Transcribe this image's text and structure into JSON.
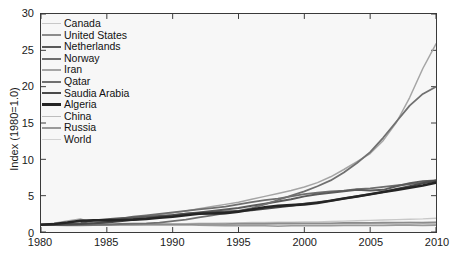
{
  "chart_data": {
    "type": "line",
    "title": "",
    "xlabel": "",
    "ylabel": "Index (1980=1.0)",
    "xlim": [
      1980,
      2010
    ],
    "ylim": [
      0,
      30
    ],
    "xticks": [
      1980,
      1985,
      1990,
      1995,
      2000,
      2005,
      2010
    ],
    "yticks": [
      0,
      5,
      10,
      15,
      20,
      25,
      30
    ],
    "grid": false,
    "legend_position": "upper-left-inside",
    "x": [
      1980,
      1981,
      1982,
      1983,
      1984,
      1985,
      1986,
      1987,
      1988,
      1989,
      1990,
      1991,
      1992,
      1993,
      1994,
      1995,
      1996,
      1997,
      1998,
      1999,
      2000,
      2001,
      2002,
      2003,
      2004,
      2005,
      2006,
      2007,
      2008,
      2009,
      2010
    ],
    "series": [
      {
        "name": "Canada",
        "color": "#c8c8c8",
        "width": 1.4,
        "values": [
          1.0,
          1.0,
          1.0,
          1.0,
          1.05,
          1.05,
          1.05,
          1.1,
          1.1,
          1.15,
          1.15,
          1.15,
          1.2,
          1.2,
          1.25,
          1.25,
          1.3,
          1.3,
          1.35,
          1.35,
          1.4,
          1.4,
          1.45,
          1.5,
          1.55,
          1.6,
          1.65,
          1.7,
          1.75,
          1.8,
          1.9
        ]
      },
      {
        "name": "United States",
        "color": "#8c8c8c",
        "width": 1.7,
        "values": [
          1.0,
          0.95,
          0.9,
          0.9,
          0.95,
          0.95,
          1.0,
          1.0,
          1.05,
          1.05,
          1.05,
          1.05,
          1.1,
          1.1,
          1.1,
          1.15,
          1.15,
          1.15,
          1.2,
          1.2,
          1.2,
          1.2,
          1.2,
          1.25,
          1.25,
          1.25,
          1.3,
          1.3,
          1.3,
          1.25,
          1.3
        ]
      },
      {
        "name": "Netherlands",
        "color": "#5a5a5a",
        "width": 2.0,
        "values": [
          1.0,
          1.05,
          1.1,
          1.2,
          1.6,
          1.75,
          1.9,
          2.0,
          2.1,
          2.2,
          2.3,
          2.5,
          2.7,
          2.9,
          3.1,
          3.3,
          3.6,
          3.9,
          4.2,
          4.5,
          4.9,
          5.2,
          5.4,
          5.6,
          5.8,
          5.7,
          5.8,
          6.3,
          6.7,
          7.0,
          7.1
        ]
      },
      {
        "name": "Norway",
        "color": "#6e6e6e",
        "width": 1.8,
        "values": [
          1.0,
          1.0,
          0.95,
          1.0,
          1.1,
          1.4,
          1.8,
          2.1,
          2.3,
          2.5,
          2.7,
          2.9,
          3.1,
          3.3,
          3.5,
          3.8,
          4.1,
          4.4,
          4.6,
          4.9,
          5.2,
          5.4,
          5.6,
          5.7,
          5.9,
          6.0,
          6.2,
          6.4,
          6.6,
          6.8,
          7.0
        ]
      },
      {
        "name": "Iran",
        "color": "#a5a5a5",
        "width": 1.5,
        "values": [
          1.0,
          1.2,
          1.5,
          1.8,
          1.2,
          1.3,
          1.6,
          1.9,
          2.1,
          2.4,
          2.6,
          2.9,
          3.2,
          3.5,
          3.8,
          4.1,
          4.5,
          4.9,
          5.3,
          5.7,
          6.2,
          6.8,
          7.6,
          8.6,
          9.7,
          10.8,
          12.6,
          15.1,
          18.5,
          22.5,
          25.9
        ]
      },
      {
        "name": "Qatar",
        "color": "#707070",
        "width": 1.8,
        "values": [
          1.0,
          1.0,
          1.0,
          1.0,
          1.0,
          1.05,
          1.1,
          1.15,
          1.2,
          1.3,
          1.5,
          1.7,
          2.0,
          2.3,
          2.6,
          2.9,
          3.3,
          3.8,
          4.4,
          5.0,
          5.6,
          6.3,
          7.1,
          8.2,
          9.5,
          11.0,
          13.0,
          15.2,
          17.4,
          19.0,
          20.0
        ]
      },
      {
        "name": "Saudia Arabia",
        "color": "#4a4a4a",
        "width": 2.1,
        "values": [
          1.0,
          1.0,
          1.05,
          1.1,
          1.2,
          1.3,
          1.5,
          1.7,
          1.9,
          2.1,
          2.3,
          2.5,
          2.6,
          2.7,
          2.8,
          2.9,
          3.0,
          3.2,
          3.4,
          3.6,
          3.9,
          4.1,
          4.3,
          4.6,
          4.9,
          5.2,
          5.5,
          5.9,
          6.3,
          6.7,
          7.1
        ]
      },
      {
        "name": "Algeria",
        "color": "#252525",
        "width": 2.6,
        "values": [
          1.0,
          1.1,
          1.3,
          1.55,
          1.6,
          1.6,
          1.65,
          1.7,
          1.8,
          1.95,
          2.1,
          2.3,
          2.5,
          2.55,
          2.6,
          2.8,
          3.1,
          3.4,
          3.6,
          3.7,
          3.8,
          4.0,
          4.3,
          4.6,
          4.9,
          5.2,
          5.5,
          5.8,
          6.1,
          6.4,
          6.8
        ]
      },
      {
        "name": "China",
        "color": "#bdbdbd",
        "width": 1.4,
        "values": [
          1.0,
          1.0,
          1.0,
          1.0,
          1.0,
          1.0,
          1.0,
          1.0,
          1.0,
          1.0,
          1.0,
          1.0,
          1.05,
          1.05,
          1.05,
          1.05,
          1.05,
          1.05,
          1.05,
          1.05,
          1.1,
          1.1,
          1.1,
          1.15,
          1.15,
          1.2,
          1.2,
          1.25,
          1.3,
          1.35,
          1.4
        ]
      },
      {
        "name": "Russia",
        "color": "#9a9a9a",
        "width": 1.6,
        "values": [
          1.0,
          1.0,
          1.0,
          1.0,
          1.0,
          1.0,
          1.0,
          1.0,
          1.0,
          1.0,
          1.0,
          1.0,
          0.95,
          0.9,
          0.85,
          0.85,
          0.85,
          0.85,
          0.8,
          0.85,
          0.85,
          0.85,
          0.85,
          0.9,
          0.9,
          0.9,
          0.9,
          0.95,
          0.95,
          0.9,
          0.95
        ]
      },
      {
        "name": "World",
        "color": "#d2d2d2",
        "width": 1.4,
        "values": [
          1.0,
          1.0,
          1.0,
          1.0,
          1.0,
          1.0,
          1.0,
          1.0,
          1.0,
          1.0,
          1.0,
          1.0,
          1.0,
          1.0,
          1.0,
          1.0,
          1.0,
          1.0,
          1.0,
          1.0,
          1.0,
          1.0,
          1.0,
          1.0,
          1.0,
          1.0,
          1.0,
          1.0,
          1.0,
          1.0,
          1.0
        ]
      }
    ]
  }
}
